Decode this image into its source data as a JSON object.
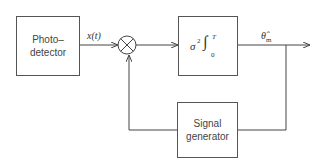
{
  "diagram": {
    "blocks": {
      "photodetector": {
        "line1": "Photo–",
        "line2": "detector"
      },
      "integrator": {
        "sigma": "σ",
        "power": "2",
        "integral": "∫",
        "upper": "T",
        "lower": "0"
      },
      "signal_generator": {
        "line1": "Signal",
        "line2": "generator"
      }
    },
    "labels": {
      "input_signal": "x(t)",
      "output_estimate": "θ̂",
      "output_subscript": "m"
    },
    "multiplier_symbol": "×"
  }
}
